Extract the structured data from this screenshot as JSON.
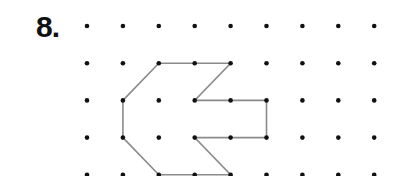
{
  "problem": {
    "number_label": "8."
  },
  "grid": {
    "columns": 9,
    "rows": 5,
    "origin_x": 87,
    "origin_y": 26,
    "spacing_x": 35.9,
    "spacing_y": 37.2,
    "dot_radius": 2.3,
    "dot_color": "#111111"
  },
  "shape": {
    "type": "arrow-polygon",
    "stroke_color": "#8a8a8a",
    "vertices_grid": [
      [
        2,
        1
      ],
      [
        4,
        1
      ],
      [
        3,
        2
      ],
      [
        5,
        2
      ],
      [
        5,
        3
      ],
      [
        3,
        3
      ],
      [
        4,
        4
      ],
      [
        2,
        4
      ],
      [
        1,
        3
      ],
      [
        1,
        2
      ]
    ]
  }
}
